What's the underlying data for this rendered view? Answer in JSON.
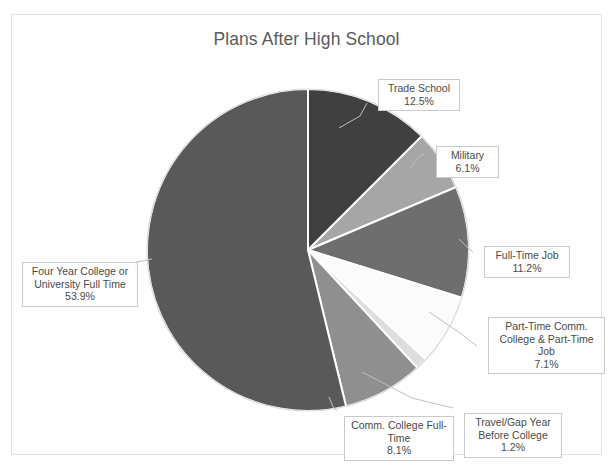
{
  "chart_data": {
    "type": "pie",
    "title": "Plans After High School",
    "xlabel": "",
    "ylabel": "",
    "legend": "none",
    "grid": false,
    "unit": "%",
    "categories": [
      "Trade School",
      "Military",
      "Full-Time Job",
      "Part-Time Comm. College & Part-Time Job",
      "Travel/Gap Year Before College",
      "Comm. College Full-Time",
      "Four Year College or University Full Time"
    ],
    "values": [
      12.5,
      6.1,
      11.2,
      7.1,
      1.2,
      8.1,
      53.9
    ],
    "slices": [
      {
        "name": "Trade School",
        "label": "Trade School",
        "value": 12.5,
        "value_label": "12.5%",
        "color": "#404040",
        "start_deg": 0,
        "end_deg": 45
      },
      {
        "name": "Military",
        "label": "Military",
        "value": 6.1,
        "value_label": "6.1%",
        "color": "#a6a6a6",
        "start_deg": 45,
        "end_deg": 66.96
      },
      {
        "name": "Full-Time Job",
        "label": "Full-Time Job",
        "value": 11.2,
        "value_label": "11.2%",
        "color": "#6e6e6e",
        "start_deg": 66.96,
        "end_deg": 107.28
      },
      {
        "name": "Part-Time Comm. College & Part-Time Job",
        "label": "Part-Time Comm. College & Part-Time Job",
        "value": 7.1,
        "value_label": "7.1%",
        "color": "#fbfbfb",
        "start_deg": 107.28,
        "end_deg": 132.84
      },
      {
        "name": "Travel/Gap Year Before College",
        "label": "Travel/Gap Year Before College",
        "value": 1.2,
        "value_label": "1.2%",
        "color": "#dedede",
        "start_deg": 132.84,
        "end_deg": 137.16
      },
      {
        "name": "Comm. College Full-Time",
        "label": "Comm. College Full-Time",
        "value": 8.1,
        "value_label": "8.1%",
        "color": "#8f8f8f",
        "start_deg": 137.16,
        "end_deg": 166.32
      },
      {
        "name": "Four Year College or University Full Time",
        "label": "Four Year College or University Full Time",
        "value": 53.9,
        "value_label": "53.9%",
        "color": "#595959",
        "start_deg": 166.32,
        "end_deg": 360
      }
    ],
    "geometry": {
      "center_x": 307,
      "center_y": 249,
      "radius": 161
    },
    "colors": {
      "title_text": "#5b5b5b",
      "label_text": "#4a4a4a",
      "frame_border": "#e3e3e3",
      "slice_border": "#ffffff",
      "leader_line": "#bfbfbf",
      "background": "#ffffff"
    }
  },
  "labels": {
    "trade_school": {
      "name": "Trade School",
      "pct": "12.5%"
    },
    "military": {
      "name": "Military",
      "pct": "6.1%"
    },
    "full_time_job": {
      "name": "Full-Time Job",
      "pct": "11.2%"
    },
    "part_time": {
      "line1": "Part-Time Comm.",
      "line2": "College & Part-Time",
      "line3": "Job",
      "pct": "7.1%"
    },
    "travel_gap": {
      "line1": "Travel/Gap Year",
      "line2": "Before College",
      "pct": "1.2%"
    },
    "comm_college": {
      "line1": "Comm. College Full-",
      "line2": "Time",
      "pct": "8.1%"
    },
    "four_year": {
      "line1": "Four Year College or",
      "line2": "University Full Time",
      "pct": "53.9%"
    }
  }
}
